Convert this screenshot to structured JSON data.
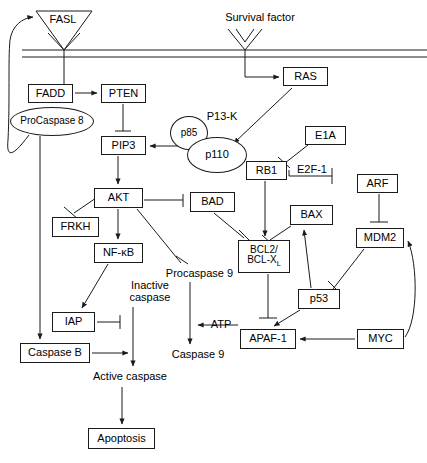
{
  "diagram": {
    "stroke_color": "#1a1a1a",
    "background": "#ffffff"
  },
  "membrane": {
    "label": "plasma-membrane",
    "y_outer": 50,
    "y_inner": 57
  },
  "nodes": [
    {
      "id": "fasl",
      "label": "FASL",
      "shape": "triangle-label",
      "x": 34,
      "y": 10,
      "w": 58,
      "h": 18
    },
    {
      "id": "survival",
      "label": "Survival factor",
      "shape": "plain",
      "x": 205,
      "y": 10,
      "w": 110,
      "h": 16
    },
    {
      "id": "fadd",
      "label": "FADD",
      "shape": "box",
      "x": 28,
      "y": 84,
      "w": 45,
      "h": 19
    },
    {
      "id": "pten",
      "label": "PTEN",
      "shape": "box",
      "x": 101,
      "y": 84,
      "w": 45,
      "h": 19
    },
    {
      "id": "procaspase8",
      "label": "ProCaspase 8",
      "shape": "ellipse",
      "x": 10,
      "y": 107,
      "w": 84,
      "h": 29
    },
    {
      "id": "ras",
      "label": "RAS",
      "shape": "box",
      "x": 283,
      "y": 67,
      "w": 45,
      "h": 19
    },
    {
      "id": "p13k",
      "label": "P13-K",
      "shape": "plain",
      "x": 200,
      "y": 110,
      "w": 44,
      "h": 14
    },
    {
      "id": "p85",
      "label": "p85",
      "shape": "ellipse",
      "x": 170,
      "y": 116,
      "w": 38,
      "h": 34
    },
    {
      "id": "p110",
      "label": "p110",
      "shape": "ellipse",
      "x": 187,
      "y": 137,
      "w": 60,
      "h": 36
    },
    {
      "id": "pip3",
      "label": "PIP3",
      "shape": "box",
      "x": 101,
      "y": 136,
      "w": 45,
      "h": 19
    },
    {
      "id": "e1a",
      "label": "E1A",
      "shape": "box",
      "x": 305,
      "y": 126,
      "w": 41,
      "h": 19
    },
    {
      "id": "rb1",
      "label": "RB1",
      "shape": "box",
      "x": 246,
      "y": 161,
      "w": 41,
      "h": 19
    },
    {
      "id": "e2f1",
      "label": "E2F-1",
      "shape": "plain",
      "x": 292,
      "y": 163,
      "w": 40,
      "h": 14
    },
    {
      "id": "arf",
      "label": "ARF",
      "shape": "box",
      "x": 357,
      "y": 174,
      "w": 41,
      "h": 19
    },
    {
      "id": "akt",
      "label": "AKT",
      "shape": "box",
      "x": 94,
      "y": 188,
      "w": 49,
      "h": 20
    },
    {
      "id": "bad",
      "label": "BAD",
      "shape": "box",
      "x": 190,
      "y": 192,
      "w": 45,
      "h": 20
    },
    {
      "id": "bax",
      "label": "BAX",
      "shape": "box",
      "x": 290,
      "y": 205,
      "w": 43,
      "h": 20
    },
    {
      "id": "frkh",
      "label": "FRKH",
      "shape": "box",
      "x": 52,
      "y": 217,
      "w": 47,
      "h": 20
    },
    {
      "id": "mdm2",
      "label": "MDM2",
      "shape": "box",
      "x": 356,
      "y": 228,
      "w": 48,
      "h": 20
    },
    {
      "id": "nfkb",
      "label": "NF-κB",
      "shape": "box",
      "x": 94,
      "y": 243,
      "w": 49,
      "h": 20
    },
    {
      "id": "bcl2",
      "label": "BCL2/\nBCL-X",
      "sublabel": "L",
      "shape": "box-two-line",
      "x": 238,
      "y": 240,
      "w": 52,
      "h": 33
    },
    {
      "id": "procaspase9",
      "label": "Procaspase 9",
      "shape": "plain",
      "x": 158,
      "y": 267,
      "w": 83,
      "h": 14
    },
    {
      "id": "inactive",
      "label": "Inactive\ncaspase",
      "shape": "plain-two-line",
      "x": 120,
      "y": 278,
      "w": 60,
      "h": 28
    },
    {
      "id": "p53",
      "label": "p53",
      "shape": "box",
      "x": 298,
      "y": 289,
      "w": 42,
      "h": 20
    },
    {
      "id": "iap",
      "label": "IAP",
      "shape": "box",
      "x": 52,
      "y": 312,
      "w": 43,
      "h": 20
    },
    {
      "id": "atp",
      "label": "ATP",
      "shape": "plain",
      "x": 205,
      "y": 318,
      "w": 32,
      "h": 14
    },
    {
      "id": "apaf1",
      "label": "APAF-1",
      "shape": "box",
      "x": 240,
      "y": 329,
      "w": 56,
      "h": 20
    },
    {
      "id": "myc",
      "label": "MYC",
      "shape": "box",
      "x": 357,
      "y": 329,
      "w": 47,
      "h": 20
    },
    {
      "id": "caspaseb",
      "label": "Caspase B",
      "shape": "box",
      "x": 20,
      "y": 343,
      "w": 70,
      "h": 20
    },
    {
      "id": "caspase9",
      "label": "Caspase 9",
      "shape": "plain",
      "x": 163,
      "y": 348,
      "w": 70,
      "h": 14
    },
    {
      "id": "activecaspase",
      "label": "Active caspase",
      "shape": "plain",
      "x": 80,
      "y": 370,
      "w": 100,
      "h": 14
    },
    {
      "id": "apoptosis",
      "label": "Apoptosis",
      "shape": "box",
      "x": 88,
      "y": 428,
      "w": 67,
      "h": 21
    }
  ],
  "edges": [
    {
      "from": "fasl",
      "to": "receptor",
      "kind": "line"
    },
    {
      "from": "receptor",
      "to": "fadd",
      "kind": "line"
    },
    {
      "from": "fadd",
      "to": "pten",
      "kind": "arrow"
    },
    {
      "from": "survival",
      "to": "receptor2",
      "kind": "line"
    },
    {
      "from": "receptor2",
      "to": "ras",
      "kind": "arrow"
    },
    {
      "from": "ras",
      "to": "p110",
      "kind": "arrow"
    },
    {
      "from": "pten",
      "to": "pip3",
      "kind": "inhibit"
    },
    {
      "from": "p110",
      "to": "pip3",
      "kind": "arrow"
    },
    {
      "from": "pip3",
      "to": "akt",
      "kind": "arrow"
    },
    {
      "from": "akt",
      "to": "frkh",
      "kind": "inhibit"
    },
    {
      "from": "akt",
      "to": "bad",
      "kind": "inhibit"
    },
    {
      "from": "akt",
      "to": "nfkb",
      "kind": "arrow"
    },
    {
      "from": "akt",
      "to": "procaspase9",
      "kind": "inhibit"
    },
    {
      "from": "bad",
      "to": "bcl2",
      "kind": "inhibit"
    },
    {
      "from": "e1a",
      "to": "rb1-e2f1",
      "kind": "inhibit"
    },
    {
      "from": "rb1",
      "to": "bcl2",
      "kind": "arrow"
    },
    {
      "from": "e2f1",
      "to": "right-stop",
      "kind": "inhibit"
    },
    {
      "from": "arf",
      "to": "mdm2",
      "kind": "inhibit"
    },
    {
      "from": "mdm2",
      "to": "p53",
      "kind": "inhibit"
    },
    {
      "from": "p53",
      "to": "bax",
      "kind": "arrow"
    },
    {
      "from": "p53",
      "to": "apaf1",
      "kind": "arrow"
    },
    {
      "from": "bax",
      "to": "bcl2",
      "kind": "inhibit"
    },
    {
      "from": "bcl2",
      "to": "apaf1",
      "kind": "inhibit"
    },
    {
      "from": "myc",
      "to": "apaf1",
      "kind": "arrow"
    },
    {
      "from": "myc",
      "to": "mdm2",
      "kind": "curved-arrow"
    },
    {
      "from": "apaf1",
      "to": "atp",
      "kind": "arrow"
    },
    {
      "from": "procaspase9",
      "to": "caspase9",
      "kind": "arrow"
    },
    {
      "from": "nfkb",
      "to": "iap",
      "kind": "arrow"
    },
    {
      "from": "iap",
      "to": "inactive",
      "kind": "inhibit"
    },
    {
      "from": "procaspase8",
      "to": "caspaseb",
      "kind": "arrow"
    },
    {
      "from": "procaspase8",
      "to": "fasl",
      "kind": "curved-arrow"
    },
    {
      "from": "caspaseb",
      "to": "activecaspase",
      "kind": "arrow"
    },
    {
      "from": "inactive",
      "to": "activecaspase",
      "kind": "arrow"
    },
    {
      "from": "activecaspase",
      "to": "apoptosis",
      "kind": "arrow"
    }
  ]
}
